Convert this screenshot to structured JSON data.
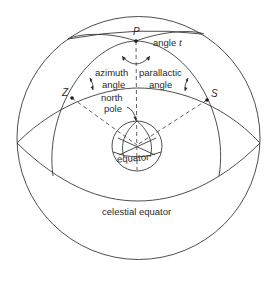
{
  "diagram": {
    "points": {
      "pole": "P",
      "zenith": "Z",
      "star": "S"
    },
    "labels": {
      "angle_t_prefix": "angle ",
      "angle_t_var": "t",
      "azimuth_line1": "azimuth",
      "azimuth_line2": "angle",
      "parallactic_line1": "parallactic",
      "parallactic_line2": "angle",
      "north_pole_line1": "north",
      "north_pole_line2": "pole",
      "equator": "equator",
      "celestial_equator": "celestial equator"
    },
    "colors": {
      "line": "#3a3a3a",
      "text": "#2a2a2a",
      "background": "#ffffff"
    }
  }
}
